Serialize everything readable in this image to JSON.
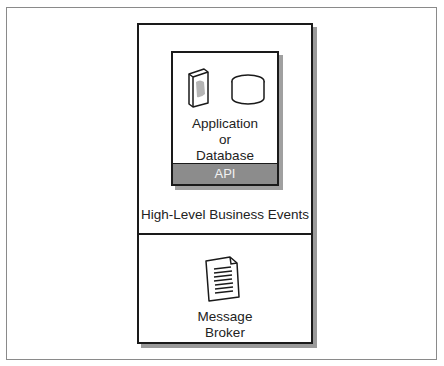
{
  "diagram": {
    "outer_frame": {},
    "top_section": {
      "inner_box": {
        "icons": [
          "book-icon",
          "database-icon"
        ],
        "label_lines": [
          "Application",
          "or",
          "Database"
        ],
        "api_label": "API"
      },
      "events_label": "High-Level Business Events"
    },
    "bottom_section": {
      "icon": "document-icon",
      "label_lines": [
        "Message",
        "Broker"
      ]
    },
    "colors": {
      "border": "#1a1a1a",
      "shadow": "#9a9a9a",
      "api_bar": "#8c8c8c",
      "api_text": "#f2f2f2"
    }
  }
}
